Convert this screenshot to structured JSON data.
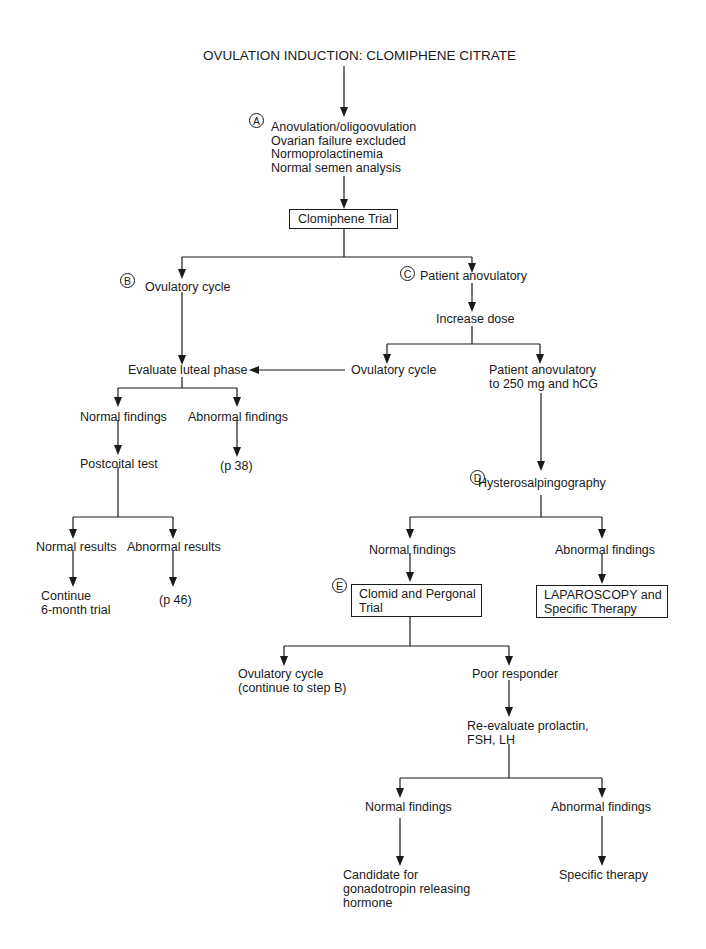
{
  "title": "OVULATION INDUCTION: CLOMIPHENE CITRATE",
  "markers": {
    "a": "A",
    "b": "B",
    "c": "C",
    "d": "D",
    "e": "E"
  },
  "nodes": {
    "criteria": [
      "Anovulation/oligoovulation",
      "Ovarian failure excluded",
      "Normoprolactinemia",
      "Normal semen analysis"
    ],
    "clomiphene_trial": "Clomiphene Trial",
    "ovulatory_cycle_b": "Ovulatory cycle",
    "patient_anovulatory": "Patient anovulatory",
    "increase_dose": "Increase dose",
    "ovulatory_cycle_c": "Ovulatory cycle",
    "anovulatory_250": [
      "Patient anovulatory",
      "to 250 mg and hCG"
    ],
    "evaluate_luteal": "Evaluate luteal phase",
    "luteal_normal": "Normal findings",
    "luteal_abnormal": "Abnormal findings",
    "postcoital_test": "Postcoital test",
    "page_38": "(p 38)",
    "normal_results": "Normal results",
    "abnormal_results": "Abnormal results",
    "continue_trial": [
      "Continue",
      "6-month trial"
    ],
    "page_46": "(p 46)",
    "hysterosalpingography": "Hysterosalpingography",
    "hsg_normal": "Normal findings",
    "hsg_abnormal": "Abnormal findings",
    "clomid_pergonal": [
      "Clomid and Pergonal",
      "Trial"
    ],
    "laparoscopy": [
      "LAPAROSCOPY and",
      "Specific Therapy"
    ],
    "ovulatory_continue": [
      "Ovulatory cycle",
      "(continue to step B)"
    ],
    "poor_responder": "Poor responder",
    "reevaluate": [
      "Re-evaluate prolactin,",
      "FSH, LH"
    ],
    "final_normal": "Normal findings",
    "final_abnormal": "Abnormal findings",
    "candidate_gnrh": [
      "Candidate for",
      "gonadotropin releasing",
      "hormone"
    ],
    "specific_therapy": "Specific therapy"
  }
}
